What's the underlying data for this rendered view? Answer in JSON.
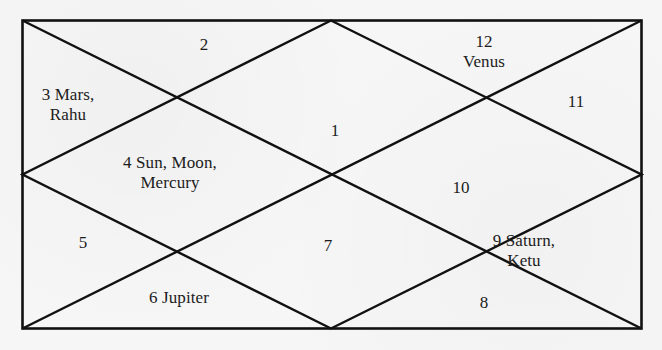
{
  "chart": {
    "type": "north-indian-horoscope",
    "houses": [
      {
        "number": "1",
        "planets": ""
      },
      {
        "number": "2",
        "planets": ""
      },
      {
        "number": "3",
        "label_line1": "3 Mars,",
        "label_line2": "Rahu"
      },
      {
        "number": "4",
        "label_line1": "4 Sun, Moon,",
        "label_line2": "Mercury"
      },
      {
        "number": "5",
        "planets": ""
      },
      {
        "number": "6",
        "label_line1": "6 Jupiter"
      },
      {
        "number": "7",
        "planets": ""
      },
      {
        "number": "8",
        "planets": ""
      },
      {
        "number": "9",
        "label_line1": "9 Saturn,",
        "label_line2": "Ketu"
      },
      {
        "number": "10",
        "planets": ""
      },
      {
        "number": "11",
        "planets": ""
      },
      {
        "number": "12",
        "label_line1": "12",
        "label_line2": "Venus"
      }
    ],
    "colors": {
      "line": "#111111",
      "background": "#f6f6f6",
      "text": "#1c1c1c"
    }
  }
}
